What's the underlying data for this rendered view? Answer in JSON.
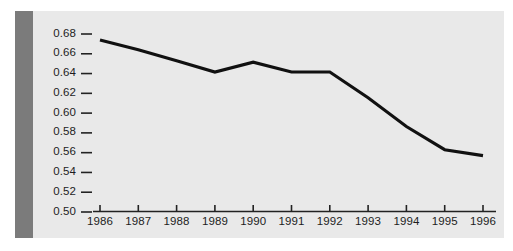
{
  "figure": {
    "panel_background": "#e9e9e9",
    "page_background": "#ffffff",
    "stripe_color": "#7b7b7b",
    "line_color": "#111111",
    "axis_color": "#222222"
  },
  "chart_data": {
    "type": "line",
    "title": "",
    "subtitle": "",
    "xlabel": "",
    "ylabel": "",
    "x": [
      1986,
      1987,
      1988,
      1989,
      1990,
      1991,
      1992,
      1993,
      1994,
      1995,
      1996
    ],
    "categories": [
      "1986",
      "1987",
      "1988",
      "1989",
      "1990",
      "1991",
      "1992",
      "1993",
      "1994",
      "1995",
      "1996"
    ],
    "values": [
      0.674,
      0.664,
      0.653,
      0.6415,
      0.6515,
      0.6415,
      0.6415,
      0.6155,
      0.5865,
      0.563,
      0.557
    ],
    "series": [
      {
        "name": "",
        "values": [
          0.674,
          0.664,
          0.653,
          0.6415,
          0.6515,
          0.6415,
          0.6415,
          0.6155,
          0.5865,
          0.563,
          0.557
        ]
      }
    ],
    "xlim": [
      1986,
      1996
    ],
    "ylim": [
      0.5,
      0.68
    ],
    "ytick_labels": [
      "0.68",
      "0.66",
      "0.64",
      "0.62",
      "0.60",
      "0.58",
      "0.56",
      "0.54",
      "0.52",
      "0.50"
    ],
    "ytick_values": [
      0.68,
      0.66,
      0.64,
      0.62,
      0.6,
      0.58,
      0.56,
      0.54,
      0.52,
      0.5
    ],
    "xtick_labels": [
      "1986",
      "1987",
      "1988",
      "1989",
      "1990",
      "1991",
      "1992",
      "1993",
      "1994",
      "1995",
      "1996"
    ],
    "grid": false,
    "legend": null,
    "legend_position": "none",
    "annotations": []
  }
}
